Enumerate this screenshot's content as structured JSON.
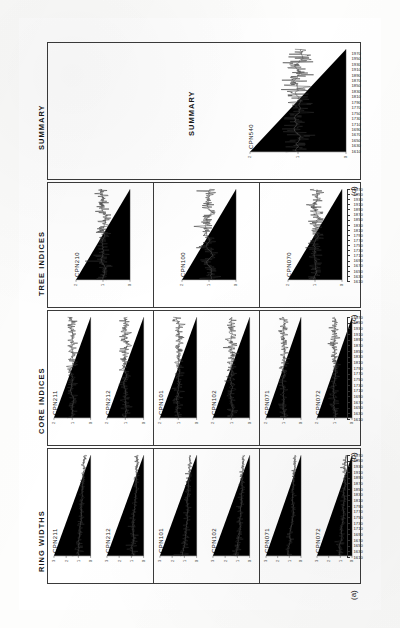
{
  "figure": {
    "orientation": "rotated-90-ccw",
    "caption_letters": [
      "(a)",
      "(b)",
      "(c)",
      "(d)"
    ],
    "columns": [
      {
        "letter": "(a)",
        "title": "RING WIDTHS",
        "groups": [
          {
            "series": [
              {
                "label": "CPN211",
                "ytitle": "",
                "yticks": [
                  "0",
                  "1",
                  "2",
                  "3"
                ]
              },
              {
                "label": "CPN212",
                "ytitle": "",
                "yticks": [
                  "0",
                  "1",
                  "2",
                  "3"
                ]
              }
            ]
          },
          {
            "series": [
              {
                "label": "CPN101",
                "ytitle": "",
                "yticks": [
                  "0",
                  "1",
                  "2",
                  "3"
                ]
              },
              {
                "label": "CPN102",
                "ytitle": "",
                "yticks": [
                  "0",
                  "1",
                  "2",
                  "3"
                ]
              }
            ]
          },
          {
            "series": [
              {
                "label": "CPN071",
                "ytitle": "",
                "yticks": [
                  "0",
                  "1",
                  "2",
                  "3"
                ]
              },
              {
                "label": "CPN072",
                "ytitle": "",
                "yticks": [
                  "0",
                  "1",
                  "2",
                  "3"
                ]
              }
            ]
          }
        ]
      },
      {
        "letter": "(b)",
        "title": "CORE INDICES",
        "groups": [
          {
            "series": [
              {
                "label": "CPN211",
                "ytitle": "",
                "yticks": [
                  "0",
                  "1",
                  "2"
                ]
              },
              {
                "label": "CPN212",
                "ytitle": "",
                "yticks": [
                  "0",
                  "1",
                  "2"
                ]
              }
            ]
          },
          {
            "series": [
              {
                "label": "CPN101",
                "ytitle": "",
                "yticks": [
                  "0",
                  "1",
                  "2"
                ]
              },
              {
                "label": "CPN102",
                "ytitle": "",
                "yticks": [
                  "0",
                  "1",
                  "2"
                ]
              }
            ]
          },
          {
            "series": [
              {
                "label": "CPN071",
                "ytitle": "",
                "yticks": [
                  "0",
                  "1",
                  "2"
                ]
              },
              {
                "label": "CPN072",
                "ytitle": "",
                "yticks": [
                  "0",
                  "1",
                  "2"
                ]
              }
            ]
          }
        ]
      },
      {
        "letter": "(c)",
        "title": "TREE INDICES",
        "groups": [
          {
            "series": [
              {
                "label": "CPN210",
                "ytitle": "",
                "yticks": [
                  "0",
                  "1",
                  "2"
                ]
              }
            ]
          },
          {
            "series": [
              {
                "label": "CPN100",
                "ytitle": "",
                "yticks": [
                  "0",
                  "1",
                  "2"
                ]
              }
            ]
          },
          {
            "series": [
              {
                "label": "CPN070",
                "ytitle": "",
                "yticks": [
                  "0",
                  "1",
                  "2"
                ]
              }
            ]
          }
        ]
      },
      {
        "letter": "(d)",
        "title": "SUMMARY",
        "groups": [
          {
            "series": [
              {
                "label": "CPN540",
                "ytitle": "",
                "yticks": [
                  "0",
                  "1",
                  "2"
                ]
              }
            ]
          }
        ]
      }
    ],
    "year_axis": {
      "label": "",
      "ticks": [
        "1610",
        "1630",
        "1650",
        "1670",
        "1690",
        "1710",
        "1730",
        "1750",
        "1770",
        "1790",
        "1810",
        "1830",
        "1850",
        "1870",
        "1890",
        "1910",
        "1930",
        "1950",
        "1970"
      ],
      "range": [
        1610,
        1980
      ]
    }
  },
  "chart_data": {
    "type": "line",
    "xlabel": "Year",
    "ylabel": "Ring width (mm) / Index",
    "xlim": [
      1610,
      1980
    ],
    "grid": false,
    "legend": "none",
    "panels": [
      {
        "panel": "(a)",
        "panel_title": "RING WIDTHS",
        "ylabel": "Ring width (mm)",
        "ylim": [
          0,
          3
        ],
        "series": [
          {
            "name": "CPN211",
            "start_year": 1612,
            "end_year": 1978,
            "mean": 0.72,
            "sd": 0.34,
            "note": "broad juvenile surge near pith then declining trend"
          },
          {
            "name": "CPN212",
            "start_year": 1612,
            "end_year": 1978,
            "mean": 0.68,
            "sd": 0.31,
            "note": "declining growth trend with late-record release"
          },
          {
            "name": "CPN101",
            "start_year": 1700,
            "end_year": 1978,
            "mean": 0.64,
            "sd": 0.28,
            "note": "moderate variability"
          },
          {
            "name": "CPN102",
            "start_year": 1700,
            "end_year": 1978,
            "mean": 0.61,
            "sd": 0.27,
            "note": "moderate variability"
          },
          {
            "name": "CPN071",
            "start_year": 1750,
            "end_year": 1978,
            "mean": 0.85,
            "sd": 0.42,
            "note": "high amplitude, several suppression events"
          },
          {
            "name": "CPN072",
            "start_year": 1750,
            "end_year": 1978,
            "mean": 0.8,
            "sd": 0.4,
            "note": "high amplitude, several suppression events"
          }
        ]
      },
      {
        "panel": "(b)",
        "panel_title": "CORE INDICES",
        "ylabel": "Index",
        "ylim": [
          0,
          2
        ],
        "series": [
          {
            "name": "CPN211",
            "start_year": 1612,
            "end_year": 1978,
            "mean": 1.0,
            "sd": 0.26
          },
          {
            "name": "CPN212",
            "start_year": 1612,
            "end_year": 1978,
            "mean": 1.0,
            "sd": 0.28
          },
          {
            "name": "CPN101",
            "start_year": 1700,
            "end_year": 1978,
            "mean": 1.0,
            "sd": 0.24
          },
          {
            "name": "CPN102",
            "start_year": 1700,
            "end_year": 1978,
            "mean": 1.0,
            "sd": 0.25
          },
          {
            "name": "CPN071",
            "start_year": 1750,
            "end_year": 1978,
            "mean": 1.0,
            "sd": 0.3
          },
          {
            "name": "CPN072",
            "start_year": 1750,
            "end_year": 1978,
            "mean": 1.0,
            "sd": 0.31
          }
        ]
      },
      {
        "panel": "(c)",
        "panel_title": "TREE INDICES",
        "ylabel": "Index",
        "ylim": [
          0,
          2
        ],
        "series": [
          {
            "name": "CPN210",
            "start_year": 1612,
            "end_year": 1978,
            "mean": 1.0,
            "sd": 0.22,
            "note": "mean of CPN211 and CPN212"
          },
          {
            "name": "CPN100",
            "start_year": 1700,
            "end_year": 1978,
            "mean": 1.0,
            "sd": 0.21,
            "note": "mean of CPN101 and CPN102"
          },
          {
            "name": "CPN070",
            "start_year": 1750,
            "end_year": 1978,
            "mean": 1.0,
            "sd": 0.25,
            "note": "mean of CPN071 and CPN072"
          }
        ]
      },
      {
        "panel": "(d)",
        "panel_title": "SUMMARY",
        "ylabel": "Index",
        "ylim": [
          0,
          2
        ],
        "series": [
          {
            "name": "CPN540",
            "start_year": 1612,
            "end_year": 1978,
            "mean": 1.0,
            "sd": 0.18,
            "note": "site summary chronology"
          }
        ]
      }
    ]
  }
}
